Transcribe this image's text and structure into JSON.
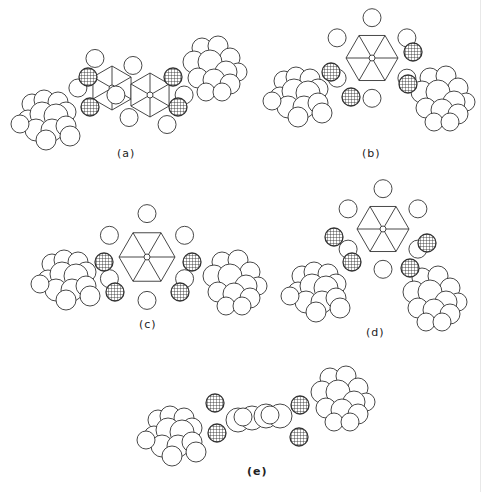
{
  "figure": {
    "atom_legend": {
      "hatched": "oxygen",
      "plain": "carbon/hydrogen"
    },
    "colors": {
      "outline": "#333333",
      "background": "#ffffff",
      "hatch": "#222222"
    },
    "panels": [
      {
        "id": "a",
        "label": "(a)"
      },
      {
        "id": "b",
        "label": "(b)"
      },
      {
        "id": "c",
        "label": "(c)"
      },
      {
        "id": "d",
        "label": "(d)"
      },
      {
        "id": "e",
        "label": "(e)"
      }
    ]
  }
}
